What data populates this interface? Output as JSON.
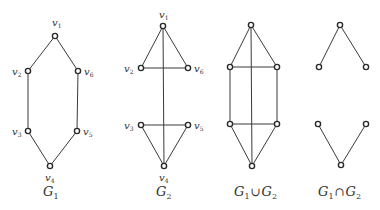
{
  "figure": {
    "graphs": [
      {
        "id": "G1",
        "caption": {
          "letter": "G",
          "sub": "1"
        },
        "nodes": [
          {
            "id": "v1",
            "label": "v",
            "sub": "1",
            "x": 55,
            "y": 36,
            "lx": 52,
            "ly": 26
          },
          {
            "id": "v2",
            "label": "v",
            "sub": "2",
            "x": 28,
            "y": 71,
            "lx": 12,
            "ly": 75
          },
          {
            "id": "v3",
            "label": "v",
            "sub": "3",
            "x": 28,
            "y": 131,
            "lx": 12,
            "ly": 135
          },
          {
            "id": "v4",
            "label": "v",
            "sub": "4",
            "x": 50,
            "y": 166,
            "lx": 45,
            "ly": 181
          },
          {
            "id": "v5",
            "label": "v",
            "sub": "5",
            "x": 77,
            "y": 131,
            "lx": 83,
            "ly": 135
          },
          {
            "id": "v6",
            "label": "v",
            "sub": "6",
            "x": 78,
            "y": 71,
            "lx": 84,
            "ly": 75
          }
        ],
        "edges": [
          [
            "v1",
            "v2"
          ],
          [
            "v2",
            "v3"
          ],
          [
            "v3",
            "v4"
          ],
          [
            "v4",
            "v5"
          ],
          [
            "v5",
            "v6"
          ],
          [
            "v6",
            "v1"
          ]
        ],
        "caption_pos": {
          "x": 43,
          "y": 196
        }
      },
      {
        "id": "G2",
        "caption": {
          "letter": "G",
          "sub": "2"
        },
        "nodes": [
          {
            "id": "v1",
            "label": "v",
            "sub": "1",
            "x": 163,
            "y": 26,
            "lx": 159,
            "ly": 18
          },
          {
            "id": "v2",
            "label": "v",
            "sub": "2",
            "x": 141,
            "y": 68,
            "lx": 124,
            "ly": 72
          },
          {
            "id": "v3",
            "label": "v",
            "sub": "3",
            "x": 141,
            "y": 125,
            "lx": 124,
            "ly": 129
          },
          {
            "id": "v4",
            "label": "v",
            "sub": "4",
            "x": 164,
            "y": 166,
            "lx": 159,
            "ly": 181
          },
          {
            "id": "v5",
            "label": "v",
            "sub": "5",
            "x": 188,
            "y": 125,
            "lx": 194,
            "ly": 129
          },
          {
            "id": "v6",
            "label": "v",
            "sub": "6",
            "x": 188,
            "y": 68,
            "lx": 194,
            "ly": 72
          }
        ],
        "edges": [
          [
            "v1",
            "v2"
          ],
          [
            "v2",
            "v6"
          ],
          [
            "v6",
            "v1"
          ],
          [
            "v1",
            "v4"
          ],
          [
            "v3",
            "v5"
          ],
          [
            "v5",
            "v4"
          ],
          [
            "v4",
            "v3"
          ]
        ],
        "caption_pos": {
          "x": 156,
          "y": 196
        }
      },
      {
        "id": "G1_union_G2",
        "caption": {
          "letter": "G",
          "sub": "1",
          "op": "∪",
          "letter2": "G",
          "sub2": "2"
        },
        "nodes": [
          {
            "id": "v1",
            "x": 251,
            "y": 25
          },
          {
            "id": "v2",
            "x": 230,
            "y": 67
          },
          {
            "id": "v3",
            "x": 230,
            "y": 124
          },
          {
            "id": "v4",
            "x": 252,
            "y": 166
          },
          {
            "id": "v5",
            "x": 277,
            "y": 124
          },
          {
            "id": "v6",
            "x": 277,
            "y": 67
          }
        ],
        "edges": [
          [
            "v1",
            "v2"
          ],
          [
            "v1",
            "v6"
          ],
          [
            "v2",
            "v6"
          ],
          [
            "v2",
            "v3"
          ],
          [
            "v6",
            "v5"
          ],
          [
            "v3",
            "v5"
          ],
          [
            "v3",
            "v4"
          ],
          [
            "v5",
            "v4"
          ],
          [
            "v1",
            "v4"
          ]
        ],
        "caption_pos": {
          "x": 234,
          "y": 196
        }
      },
      {
        "id": "G1_intersect_G2",
        "caption": {
          "letter": "G",
          "sub": "1",
          "op": "∩",
          "letter2": "G",
          "sub2": "2"
        },
        "nodes": [
          {
            "id": "v1",
            "x": 340,
            "y": 25
          },
          {
            "id": "v2",
            "x": 319,
            "y": 67
          },
          {
            "id": "v3",
            "x": 318,
            "y": 124
          },
          {
            "id": "v4",
            "x": 341,
            "y": 165
          },
          {
            "id": "v5",
            "x": 366,
            "y": 124
          },
          {
            "id": "v6",
            "x": 366,
            "y": 67
          }
        ],
        "edges": [
          [
            "v1",
            "v2"
          ],
          [
            "v1",
            "v6"
          ],
          [
            "v3",
            "v4"
          ],
          [
            "v4",
            "v5"
          ]
        ],
        "caption_pos": {
          "x": 318,
          "y": 196
        }
      }
    ],
    "colors": {
      "line": "#3a3a3a",
      "node_stroke": "#2a2a2a",
      "text": "#333333",
      "background": "#ffffff"
    }
  }
}
